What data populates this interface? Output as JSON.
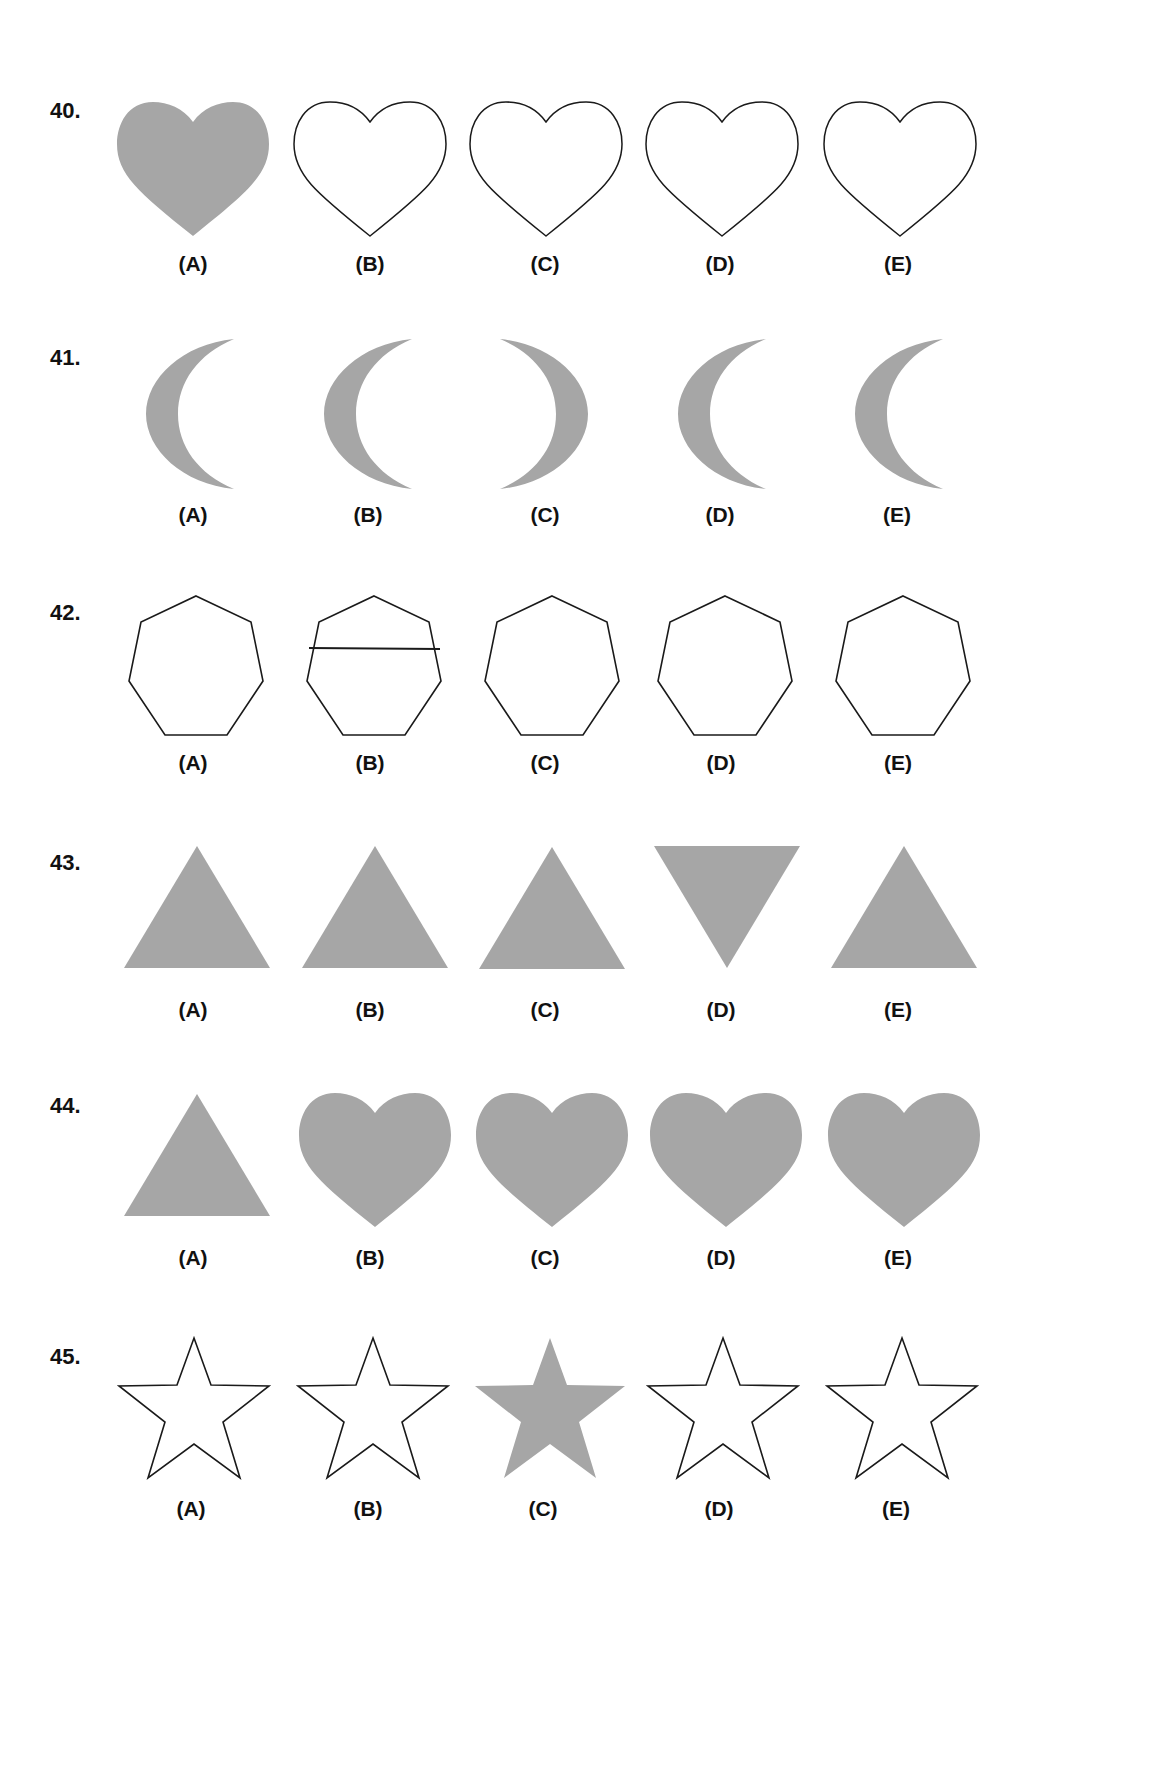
{
  "colors": {
    "fill": "#a6a6a6",
    "stroke": "#1a1a1a",
    "background": "#ffffff"
  },
  "questions": [
    {
      "number": "40.",
      "options": [
        {
          "label": "(A)",
          "shape": "heart",
          "style": "filled"
        },
        {
          "label": "(B)",
          "shape": "heart",
          "style": "outline"
        },
        {
          "label": "(C)",
          "shape": "heart",
          "style": "outline"
        },
        {
          "label": "(D)",
          "shape": "heart",
          "style": "outline"
        },
        {
          "label": "(E)",
          "shape": "heart",
          "style": "outline"
        }
      ]
    },
    {
      "number": "41.",
      "options": [
        {
          "label": "(A)",
          "shape": "crescent-left",
          "style": "filled"
        },
        {
          "label": "(B)",
          "shape": "crescent-left",
          "style": "filled"
        },
        {
          "label": "(C)",
          "shape": "crescent-right",
          "style": "filled"
        },
        {
          "label": "(D)",
          "shape": "crescent-left",
          "style": "filled"
        },
        {
          "label": "(E)",
          "shape": "crescent-left",
          "style": "filled"
        }
      ]
    },
    {
      "number": "42.",
      "options": [
        {
          "label": "(A)",
          "shape": "heptagon",
          "style": "outline"
        },
        {
          "label": "(B)",
          "shape": "heptagon-with-line",
          "style": "outline"
        },
        {
          "label": "(C)",
          "shape": "heptagon",
          "style": "outline"
        },
        {
          "label": "(D)",
          "shape": "heptagon",
          "style": "outline"
        },
        {
          "label": "(E)",
          "shape": "heptagon",
          "style": "outline"
        }
      ]
    },
    {
      "number": "43.",
      "options": [
        {
          "label": "(A)",
          "shape": "triangle-up",
          "style": "filled"
        },
        {
          "label": "(B)",
          "shape": "triangle-up",
          "style": "filled"
        },
        {
          "label": "(C)",
          "shape": "triangle-up",
          "style": "filled"
        },
        {
          "label": "(D)",
          "shape": "triangle-down",
          "style": "filled"
        },
        {
          "label": "(E)",
          "shape": "triangle-up",
          "style": "filled"
        }
      ]
    },
    {
      "number": "44.",
      "options": [
        {
          "label": "(A)",
          "shape": "triangle-up",
          "style": "filled"
        },
        {
          "label": "(B)",
          "shape": "heart",
          "style": "filled"
        },
        {
          "label": "(C)",
          "shape": "heart",
          "style": "filled"
        },
        {
          "label": "(D)",
          "shape": "heart",
          "style": "filled"
        },
        {
          "label": "(E)",
          "shape": "heart",
          "style": "filled"
        }
      ]
    },
    {
      "number": "45.",
      "options": [
        {
          "label": "(A)",
          "shape": "star",
          "style": "outline"
        },
        {
          "label": "(B)",
          "shape": "star",
          "style": "outline"
        },
        {
          "label": "(C)",
          "shape": "star",
          "style": "filled"
        },
        {
          "label": "(D)",
          "shape": "star",
          "style": "outline"
        },
        {
          "label": "(E)",
          "shape": "star",
          "style": "outline"
        }
      ]
    }
  ]
}
